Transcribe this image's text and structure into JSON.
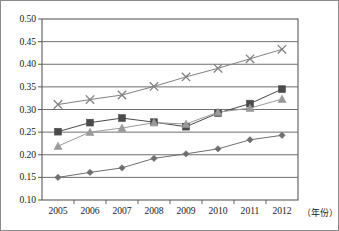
{
  "chart_data": {
    "type": "line",
    "title": "",
    "xlabel": "（年份）",
    "ylabel": "",
    "categories": [
      "2005",
      "2006",
      "2007",
      "2008",
      "2009",
      "2010",
      "2011",
      "2012"
    ],
    "x": [
      2005,
      2006,
      2007,
      2008,
      2009,
      2010,
      2011,
      2012
    ],
    "ylim": [
      0.1,
      0.5
    ],
    "ytick_labels": [
      "0.10",
      "0.15",
      "0.20",
      "0.25",
      "0.30",
      "0.35",
      "0.40",
      "0.45",
      "0.50"
    ],
    "ytick_values": [
      0.1,
      0.15,
      0.2,
      0.25,
      0.3,
      0.35,
      0.4,
      0.45,
      0.5
    ],
    "grid": "horizontal",
    "legend": "none",
    "series": [
      {
        "name": "series-cross",
        "marker": "cross",
        "color": "#808080",
        "values": [
          0.311,
          0.322,
          0.332,
          0.351,
          0.372,
          0.391,
          0.412,
          0.433
        ]
      },
      {
        "name": "series-square",
        "marker": "square",
        "color": "#4a4a4a",
        "values": [
          0.251,
          0.271,
          0.281,
          0.272,
          0.262,
          0.292,
          0.313,
          0.345
        ]
      },
      {
        "name": "series-triangle",
        "marker": "triangle",
        "color": "#9a9a9a",
        "values": [
          0.219,
          0.25,
          0.259,
          0.271,
          0.268,
          0.294,
          0.303,
          0.323
        ]
      },
      {
        "name": "series-diamond",
        "marker": "diamond",
        "color": "#6e6e6e",
        "values": [
          0.15,
          0.161,
          0.171,
          0.192,
          0.202,
          0.213,
          0.233,
          0.243
        ]
      }
    ]
  },
  "axis": {
    "x_axis_title": "（年份）"
  },
  "colors": {
    "plot_border": "#5a5a5a",
    "gridline": "#6e6e6e",
    "outer_border": "#8c8c8c",
    "text": "#1b1b1b"
  }
}
